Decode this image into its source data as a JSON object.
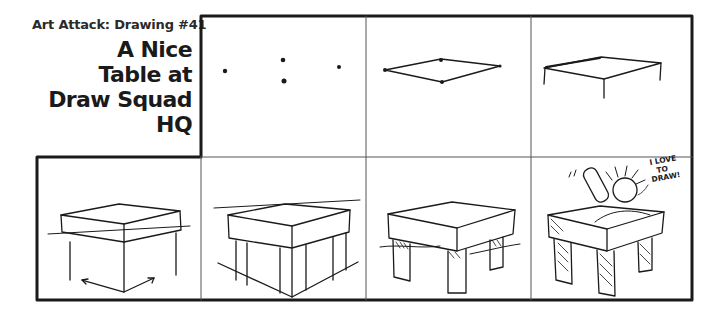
{
  "header": {
    "subtitle": "Art Attack: Drawing #41",
    "title_lines": [
      "A Nice",
      "Table at",
      "Draw Squad",
      "HQ"
    ]
  },
  "panels": [
    {
      "index": 1,
      "row": "top",
      "content": "four dots"
    },
    {
      "index": 2,
      "row": "top",
      "content": "dots connected into tabletop rhombus"
    },
    {
      "index": 3,
      "row": "top",
      "content": "tabletop with short legs"
    },
    {
      "index": 4,
      "row": "bottom",
      "content": "box tabletop with perspective arrows"
    },
    {
      "index": 5,
      "row": "bottom",
      "content": "tabletop with box base and arrows"
    },
    {
      "index": 6,
      "row": "bottom",
      "content": "table with legs and shading"
    },
    {
      "index": 7,
      "row": "bottom",
      "content": "cartoon artist drawing at shaded table",
      "speech": [
        "I LOVE",
        "TO",
        "DRAW!"
      ]
    }
  ],
  "colors": {
    "ink": "#1a1a1a",
    "paper": "#ffffff"
  }
}
